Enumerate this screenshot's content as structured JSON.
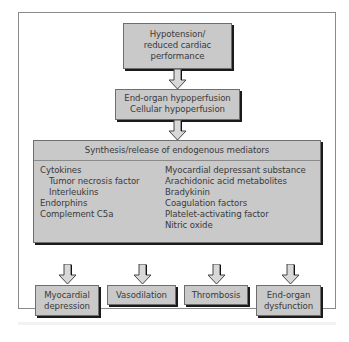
{
  "diagram": {
    "top_box": {
      "lines": [
        "Hypotension/",
        "reduced cardiac",
        "performance"
      ]
    },
    "middle_box": {
      "lines": [
        "End-organ hypoperfusion",
        "Cellular hypoperfusion"
      ]
    },
    "mediators_box": {
      "header": "Synthesis/release of endogenous mediators",
      "left_column": [
        {
          "text": "Cytokines",
          "indent": false
        },
        {
          "text": "Tumor necrosis factor",
          "indent": true
        },
        {
          "text": "Interleukins",
          "indent": true
        },
        {
          "text": "Endorphins",
          "indent": false
        },
        {
          "text": "Complement C5a",
          "indent": false
        }
      ],
      "right_column": [
        "Myocardial depressant substance",
        "Arachidonic acid metabolites",
        "Bradykinin",
        "Coagulation factors",
        "Platelet-activating factor",
        "Nitric oxide"
      ]
    },
    "outcomes": [
      {
        "lines": [
          "Myocardial",
          "depression"
        ]
      },
      {
        "lines": [
          "Vasodilation"
        ]
      },
      {
        "lines": [
          "Thrombosis"
        ]
      },
      {
        "lines": [
          "End-organ",
          "dysfunction"
        ]
      }
    ],
    "colors": {
      "box_fill": "#c9c9c9",
      "box_border": "#6e6e6e",
      "shadow": "#1a1a1a",
      "arrow_fill": "#d8d8d8",
      "text": "#3a3a3a",
      "frame": "#8a8a8a"
    }
  }
}
